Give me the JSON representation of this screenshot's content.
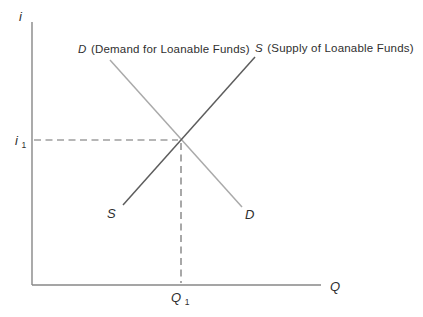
{
  "figure": {
    "type": "supply-demand-diagram",
    "axes": {
      "y_label": "i",
      "x_label": "Q"
    },
    "curves": {
      "demand": {
        "symbol": "D",
        "description": "(Demand for Loanable Funds)",
        "end_label": "D",
        "direction": "downward-sloping",
        "color": "#aaaaaa"
      },
      "supply": {
        "symbol": "S",
        "description": "(Supply of Loanable Funds)",
        "end_label": "S",
        "direction": "upward-sloping",
        "color": "#5d5d5d"
      }
    },
    "equilibrium": {
      "rate_symbol": "i",
      "rate_subscript": "1",
      "quantity_symbol": "Q",
      "quantity_subscript": "1"
    },
    "colors": {
      "axis": "#878787",
      "dashed_guide": "#6f6f6f",
      "text": "#2f2f2f",
      "background": "#ffffff"
    }
  }
}
